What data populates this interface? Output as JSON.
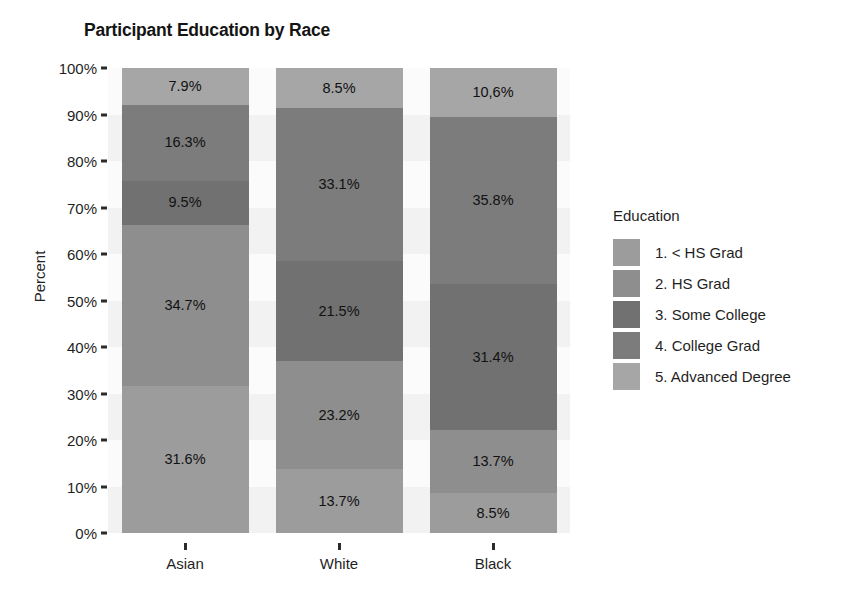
{
  "chart_data": {
    "type": "bar",
    "subtype": "stacked-percent",
    "title": "Participant Education by Race",
    "xlabel": "",
    "ylabel": "Percent",
    "categories": [
      "Asian",
      "White",
      "Black"
    ],
    "ylim": [
      0,
      100
    ],
    "ytick_labels": [
      "0%",
      "10%",
      "20%",
      "30%",
      "40%",
      "50%",
      "60%",
      "70%",
      "80%",
      "90%",
      "100%"
    ],
    "ytick_values": [
      0,
      10,
      20,
      30,
      40,
      50,
      60,
      70,
      80,
      90,
      100
    ],
    "grid": false,
    "legend_title": "Education",
    "legend_position": "right",
    "series": [
      {
        "name": "1. < HS Grad",
        "color": "#9c9c9c",
        "values": [
          31.6,
          13.7,
          8.5
        ],
        "labels": [
          "31.6%",
          "13.7%",
          "8.5%"
        ]
      },
      {
        "name": "2. HS Grad",
        "color": "#8e8e8e",
        "values": [
          34.7,
          23.2,
          13.7
        ],
        "labels": [
          "34.7%",
          "23.2%",
          "13.7%"
        ]
      },
      {
        "name": "3. Some College",
        "color": "#717171",
        "values": [
          9.5,
          21.5,
          31.4
        ],
        "labels": [
          "9.5%",
          "21.5%",
          "31.4%"
        ]
      },
      {
        "name": "4. College Grad",
        "color": "#7c7c7c",
        "values": [
          16.3,
          33.1,
          35.8
        ],
        "labels": [
          "16.3%",
          "33.1%",
          "35.8%"
        ]
      },
      {
        "name": "5. Advanced Degree",
        "color": "#a6a6a6",
        "values": [
          7.9,
          8.5,
          10.6
        ],
        "labels": [
          "7.9%",
          "8.5%",
          "10,6%"
        ]
      }
    ]
  },
  "legend": {
    "title": "Education",
    "items": [
      {
        "label": "1. < HS Grad",
        "color": "#9c9c9c"
      },
      {
        "label": "2. HS Grad",
        "color": "#8e8e8e"
      },
      {
        "label": "3. Some College",
        "color": "#717171"
      },
      {
        "label": "4. College Grad",
        "color": "#7c7c7c"
      },
      {
        "label": "5. Advanced Degree",
        "color": "#a6a6a6"
      }
    ]
  }
}
